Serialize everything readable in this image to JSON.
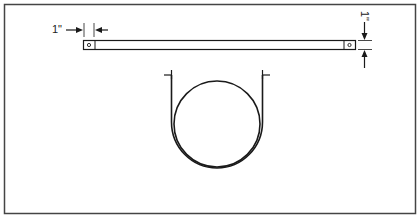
{
  "diagram": {
    "labels": {
      "horizontal_dimension": "1\"",
      "vertical_dimension": "1\""
    },
    "colors": {
      "line": "#1a1a1a",
      "frame": "#444444",
      "background": "#ffffff"
    }
  }
}
